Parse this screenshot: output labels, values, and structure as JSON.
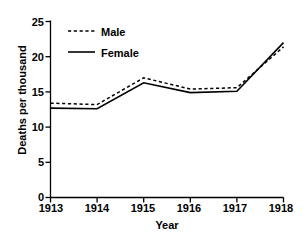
{
  "chart_data": {
    "type": "line",
    "title": "",
    "subtitle": "",
    "xlabel": "Year",
    "ylabel": "Deaths per thousand",
    "x": [
      1913,
      1914,
      1915,
      1916,
      1917,
      1918
    ],
    "categories": [
      "1913",
      "1914",
      "1915",
      "1916",
      "1917",
      "1918"
    ],
    "xtick_labels": [
      "1913",
      "1914",
      "1915",
      "1916",
      "1917",
      "1918"
    ],
    "ytick_labels": [
      "0",
      "5",
      "10",
      "15",
      "20",
      "25"
    ],
    "ytick_values": [
      0,
      5,
      10,
      15,
      20,
      25
    ],
    "xlim": [
      1913,
      1918
    ],
    "ylim": [
      0,
      25
    ],
    "grid": false,
    "legend_position": "top-left",
    "series": [
      {
        "name": "Male",
        "style": "dashed",
        "color": "#000000",
        "values": [
          13.4,
          13.2,
          17.0,
          15.4,
          15.6,
          21.4
        ]
      },
      {
        "name": "Female",
        "style": "solid",
        "color": "#000000",
        "values": [
          12.7,
          12.6,
          16.3,
          14.9,
          15.1,
          22.0
        ]
      }
    ]
  },
  "legend": {
    "items": [
      {
        "label": "Male",
        "style": "dashed"
      },
      {
        "label": "Female",
        "style": "solid"
      }
    ]
  },
  "axes": {
    "y_title": "Deaths per thousand",
    "x_title": "Year"
  }
}
